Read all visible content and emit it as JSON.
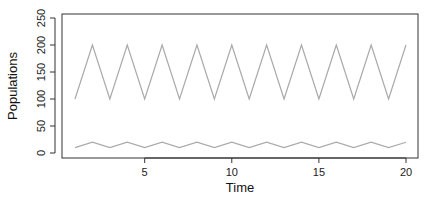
{
  "chart_data": {
    "type": "line",
    "title": "",
    "xlabel": "Time",
    "ylabel": "Populations",
    "xlim": [
      1,
      20
    ],
    "ylim": [
      0,
      250
    ],
    "xticks": [
      5,
      10,
      15,
      20
    ],
    "yticks": [
      0,
      50,
      100,
      150,
      200,
      250
    ],
    "grid": false,
    "legend": null,
    "x": [
      1,
      2,
      3,
      4,
      5,
      6,
      7,
      8,
      9,
      10,
      11,
      12,
      13,
      14,
      15,
      16,
      17,
      18,
      19,
      20
    ],
    "series": [
      {
        "name": "Series 1",
        "color": "#aaaaaa",
        "values": [
          100,
          200,
          100,
          200,
          100,
          200,
          100,
          200,
          100,
          200,
          100,
          200,
          100,
          200,
          100,
          200,
          100,
          200,
          100,
          200
        ]
      },
      {
        "name": "Series 2",
        "color": "#aaaaaa",
        "values": [
          10,
          20,
          10,
          20,
          10,
          20,
          10,
          20,
          10,
          20,
          10,
          20,
          10,
          20,
          10,
          20,
          10,
          20,
          10,
          20
        ]
      }
    ]
  }
}
